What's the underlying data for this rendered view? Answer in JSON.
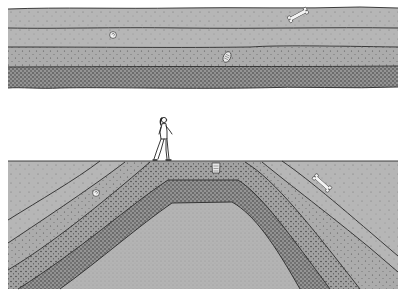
{
  "colors": {
    "background": "#ffffff",
    "layer_light": "#b4b4b4",
    "layer_mid": "#aaaaaa",
    "layer_dark": "#9c9c9c",
    "layer_darker": "#8e8e8e",
    "core": "#b2b2b2",
    "line": "#2a2a2a",
    "fossil": "#f4f4f4"
  },
  "panels": [
    {
      "name": "horizontal-strata",
      "layers": [
        "layer-1-top",
        "layer-2",
        "layer-3",
        "layer-4-bottom"
      ],
      "fossils": [
        "bone",
        "snail-shell",
        "trilobite"
      ]
    },
    {
      "name": "folded-strata-anticline",
      "figure": "person-walking",
      "layers": [
        "outer-layer",
        "layer-2",
        "layer-3",
        "dark-band",
        "core"
      ],
      "fossils": [
        "snail-shell",
        "trilobite",
        "bone"
      ]
    }
  ]
}
